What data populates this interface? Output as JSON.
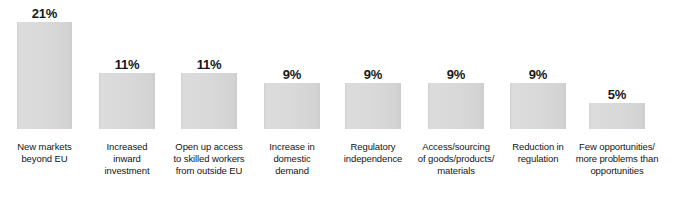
{
  "chart_data": {
    "type": "bar",
    "title": "",
    "subtitle": "",
    "xlabel": "",
    "ylabel": "",
    "ylim": [
      0,
      21
    ],
    "grid": false,
    "legend": "none",
    "orientation": "vertical",
    "bar_color": "#d6d6d6",
    "value_label_color": "#171717",
    "category_label_color": "#151515",
    "background": "#ffffff",
    "categories": [
      "New markets\nbeyond EU",
      "Increased\ninward\ninvestment",
      "Open up access\nto skilled workers\nfrom outside EU",
      "Increase in\ndomestic\ndemand",
      "Regulatory\nindependence",
      "Access/sourcing\nof goods/products/\nmaterials",
      "Reduction in\nregulation",
      "Few opportunities/\nmore problems than\nopportunities"
    ],
    "values": [
      21,
      11,
      11,
      9,
      9,
      9,
      9,
      5
    ],
    "value_labels": [
      "21%",
      "11%",
      "11%",
      "9%",
      "9%",
      "9%",
      "9%",
      "5%"
    ],
    "bars": [
      {
        "label": "New markets\nbeyond EU",
        "value": 21,
        "value_label": "21%",
        "x": 17,
        "width": 55,
        "top": 22,
        "height": 107
      },
      {
        "label": "Increased\ninward\ninvestment",
        "value": 11,
        "value_label": "11%",
        "x": 99,
        "width": 56,
        "top": 73,
        "height": 56
      },
      {
        "label": "Open up access\nto skilled workers\nfrom outside EU",
        "value": 11,
        "value_label": "11%",
        "x": 181,
        "width": 56,
        "top": 73,
        "height": 56
      },
      {
        "label": "Increase in\ndomestic\ndemand",
        "value": 9,
        "value_label": "9%",
        "x": 264,
        "width": 56,
        "top": 83,
        "height": 46
      },
      {
        "label": "Regulatory\nindependence",
        "value": 9,
        "value_label": "9%",
        "x": 345,
        "width": 56,
        "top": 83,
        "height": 46
      },
      {
        "label": "Access/sourcing\nof goods/products/\nmaterials",
        "value": 9,
        "value_label": "9%",
        "x": 428,
        "width": 56,
        "top": 83,
        "height": 46
      },
      {
        "label": "Reduction in\nregulation",
        "value": 9,
        "value_label": "9%",
        "x": 510,
        "width": 56,
        "top": 83,
        "height": 46
      },
      {
        "label": "Few opportunities/\nmore problems than\nopportunities",
        "value": 5,
        "value_label": "5%",
        "x": 589,
        "width": 56,
        "top": 103,
        "height": 26
      }
    ]
  }
}
